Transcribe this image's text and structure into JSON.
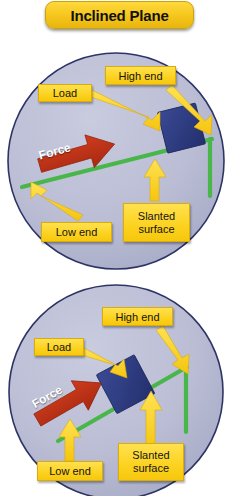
{
  "title": {
    "text": "Inclined Plane"
  },
  "colors": {
    "banner_yellow": "#f5c51c",
    "label_yellow": "#fcd21f",
    "circle_fill": "#b9bcd4",
    "circle_border": "#2e3566",
    "ramp_green": "#49b649",
    "load_blue": "#2b3a7e",
    "force_red": "#bf3118",
    "arrow_yellow": "#ffd52e",
    "text_black": "#141414"
  },
  "diagrams": [
    {
      "name": "inclined-plane-shallow",
      "labels": {
        "load": "Load",
        "high_end": "High end",
        "low_end": "Low end",
        "slanted_surface_line1": "Slanted",
        "slanted_surface_line2": "surface",
        "force": "Force"
      }
    },
    {
      "name": "inclined-plane-steep",
      "labels": {
        "load": "Load",
        "high_end": "High end",
        "low_end": "Low end",
        "slanted_surface_line1": "Slanted",
        "slanted_surface_line2": "surface",
        "force": "Force"
      }
    }
  ]
}
